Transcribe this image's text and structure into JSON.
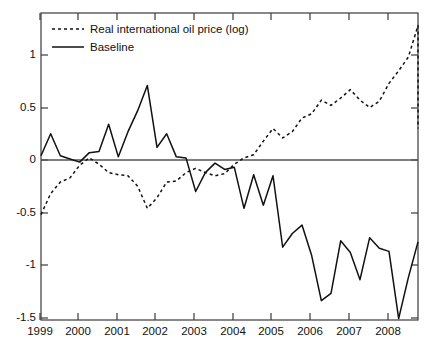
{
  "chart_data": {
    "type": "line",
    "title": "",
    "subtitle": "",
    "xlabel": "",
    "ylabel": "",
    "xlim": [
      1999.0,
      2008.75
    ],
    "ylim": [
      -1.72,
      1.45
    ],
    "grid": false,
    "legend_position": "top-left",
    "yticks": [
      1,
      0.5,
      0,
      -0.5,
      -1,
      -1.5
    ],
    "ytick_labels": [
      "1",
      "0.5",
      "0",
      "-0.5",
      "-1",
      "-1.5"
    ],
    "xticks": [
      1999,
      2000,
      2001,
      2002,
      2003,
      2004,
      2005,
      2006,
      2007,
      2008
    ],
    "xtick_labels": [
      "1999",
      "2000",
      "2001",
      "2002",
      "2003",
      "2004",
      "2005",
      "2006",
      "2007",
      "2008"
    ],
    "zero_line": 0,
    "x": [
      1999.0,
      1999.25,
      1999.5,
      1999.75,
      2000.0,
      2000.25,
      2000.5,
      2000.75,
      2001.0,
      2001.25,
      2001.5,
      2001.75,
      2002.0,
      2002.25,
      2002.5,
      2002.75,
      2003.0,
      2003.25,
      2003.5,
      2003.75,
      2004.0,
      2004.25,
      2004.5,
      2004.75,
      2005.0,
      2005.25,
      2005.5,
      2005.75,
      2006.0,
      2006.25,
      2006.5,
      2006.75,
      2007.0,
      2007.25,
      2007.5,
      2007.75,
      2008.0,
      2008.25,
      2008.5,
      2008.75
    ],
    "series": [
      {
        "name": "Real international oil price (log)",
        "style": "dotted",
        "color": "#111111",
        "values": [
          -0.52,
          -0.32,
          -0.21,
          -0.17,
          -0.05,
          0.02,
          -0.04,
          -0.12,
          -0.14,
          -0.15,
          -0.25,
          -0.46,
          -0.36,
          -0.21,
          -0.2,
          -0.12,
          -0.08,
          -0.12,
          -0.15,
          -0.13,
          -0.04,
          0.02,
          0.05,
          0.18,
          0.3,
          0.21,
          0.27,
          0.4,
          0.44,
          0.57,
          0.52,
          0.59,
          0.67,
          0.57,
          0.5,
          0.56,
          0.73,
          0.85,
          0.98,
          1.28
        ]
      },
      {
        "name": "Baseline",
        "style": "solid",
        "color": "#111111",
        "values": [
          0.04,
          0.25,
          0.04,
          0.01,
          -0.02,
          0.07,
          0.08,
          0.34,
          0.03,
          0.27,
          0.47,
          0.71,
          0.12,
          0.25,
          0.03,
          0.02,
          -0.3,
          -0.12,
          -0.03,
          -0.09,
          -0.07,
          -0.46,
          -0.14,
          -0.43,
          -0.15,
          -0.83,
          -0.7,
          -0.62,
          -0.91,
          -1.34,
          -1.27,
          -0.77,
          -0.88,
          -1.14,
          -0.74,
          -0.84,
          -0.87,
          -1.51,
          -1.12,
          -0.78
        ]
      }
    ],
    "tail_segment": {
      "note": "final dotted drop at right edge",
      "oil_price_drop_to": 0.3
    }
  },
  "legend": {
    "entries": [
      {
        "label": "Real international oil price (log)",
        "style": "dotted"
      },
      {
        "label": "Baseline",
        "style": "solid"
      }
    ]
  },
  "axis": {
    "ytick_labels": [
      "1",
      "0.5",
      "0",
      "-0.5",
      "-1",
      "-1.5"
    ],
    "xtick_labels": [
      "1999",
      "2000",
      "2001",
      "2002",
      "2003",
      "2004",
      "2005",
      "2006",
      "2007",
      "2008"
    ]
  },
  "colors": {
    "line": "#111111",
    "frame": "#3a3a3a",
    "zero_line": "#555555",
    "background": "#ffffff"
  }
}
